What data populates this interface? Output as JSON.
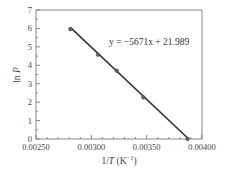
{
  "chart_data": {
    "type": "scatter",
    "title": "",
    "xlabel": "1/T (K⁻¹)",
    "ylabel": "ln P",
    "xlim": [
      0.0025,
      0.004
    ],
    "ylim": [
      0,
      7
    ],
    "x_ticks": [
      "0.00250",
      "0.00300",
      "0.00350",
      "0.00400"
    ],
    "x_tick_values": [
      0.0025,
      0.003,
      0.0035,
      0.004
    ],
    "y_ticks": [
      "0",
      "1",
      "2",
      "3",
      "4",
      "5",
      "6",
      "7"
    ],
    "y_tick_values": [
      0,
      1,
      2,
      3,
      4,
      5,
      6,
      7
    ],
    "grid": false,
    "legend": null,
    "series": [
      {
        "name": "data",
        "x": [
          0.00281,
          0.00306,
          0.00323,
          0.00347,
          0.00387
        ],
        "y": [
          5.96,
          4.57,
          3.7,
          2.26,
          0.0
        ]
      }
    ],
    "trendline": {
      "slope": -5671,
      "intercept": 21.989,
      "x_range": [
        0.00281,
        0.00388
      ],
      "equation": "y = −5671x + 21.989"
    },
    "annotations": [
      {
        "text": "y = −5671x + 21.989",
        "x": 0.00335,
        "y": 5.7
      }
    ],
    "colors": {
      "line": "#333333",
      "marker": "#666666",
      "frame": "#888888"
    }
  }
}
